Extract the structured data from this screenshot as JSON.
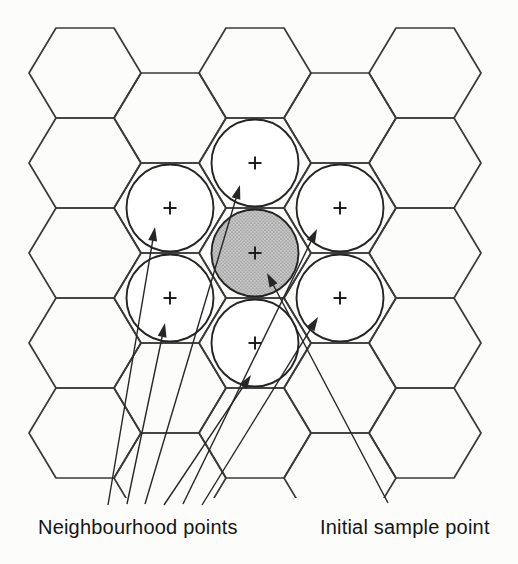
{
  "labels": {
    "neighbourhood": "Neighbourhood points",
    "initial": "Initial sample point"
  },
  "colors": {
    "background": "#fcfcfb",
    "grid_line": "#3a3a3a",
    "circle_outline": "#242424",
    "circle_fill": "#ffffff",
    "shaded_base": "#c9c9c9",
    "shaded_dot": "#8e8e8e",
    "arrow": "#262626",
    "plus": "#161616",
    "text": "#141414"
  },
  "diagram": {
    "width": 518,
    "height": 564,
    "hex": {
      "half_side": 29,
      "half_width": 56,
      "half_height": 45,
      "stroke_width": 1.7,
      "clip_bottom": 498,
      "centers": [
        [
          85,
          73
        ],
        [
          85,
          163
        ],
        [
          85,
          253
        ],
        [
          85,
          343
        ],
        [
          85,
          433
        ],
        [
          255,
          73
        ],
        [
          255,
          163
        ],
        [
          255,
          253
        ],
        [
          255,
          343
        ],
        [
          255,
          433
        ],
        [
          425,
          73
        ],
        [
          425,
          163
        ],
        [
          425,
          253
        ],
        [
          425,
          343
        ],
        [
          425,
          433
        ],
        [
          170,
          118
        ],
        [
          170,
          208
        ],
        [
          170,
          298
        ],
        [
          170,
          388
        ],
        [
          170,
          478
        ],
        [
          340,
          118
        ],
        [
          340,
          208
        ],
        [
          340,
          298
        ],
        [
          340,
          388
        ],
        [
          340,
          478
        ]
      ]
    },
    "circles": {
      "radius": 43.5,
      "stroke_width": 1.9,
      "plus_half": 6.5,
      "plus_stroke": 1.9,
      "items": [
        {
          "name": "initial-sample-circle",
          "cx": 255,
          "cy": 253,
          "shaded": true
        },
        {
          "name": "neighbour-circle-top",
          "cx": 255,
          "cy": 163,
          "shaded": false
        },
        {
          "name": "neighbour-circle-upper-left",
          "cx": 170,
          "cy": 208,
          "shaded": false
        },
        {
          "name": "neighbour-circle-upper-right",
          "cx": 340,
          "cy": 208,
          "shaded": false
        },
        {
          "name": "neighbour-circle-lower-left",
          "cx": 170,
          "cy": 298,
          "shaded": false
        },
        {
          "name": "neighbour-circle-lower-right",
          "cx": 340,
          "cy": 298,
          "shaded": false
        },
        {
          "name": "neighbour-circle-bottom",
          "cx": 255,
          "cy": 343,
          "shaded": false
        }
      ]
    },
    "arrows": {
      "stroke_width": 1.4,
      "head_length": 14,
      "head_width": 9,
      "items": [
        {
          "name": "arrow-neighbour-upper-left",
          "from": [
            108,
            505
          ],
          "to": [
            155,
            227
          ]
        },
        {
          "name": "arrow-neighbour-lower-left",
          "from": [
            127,
            504
          ],
          "to": [
            165,
            323
          ]
        },
        {
          "name": "arrow-neighbour-top",
          "from": [
            145,
            504
          ],
          "to": [
            240,
            185
          ]
        },
        {
          "name": "arrow-neighbour-bottom",
          "from": [
            164,
            505
          ],
          "to": [
            251,
            375
          ]
        },
        {
          "name": "arrow-neighbour-upper-right",
          "from": [
            183,
            504
          ],
          "to": [
            317,
            229
          ]
        },
        {
          "name": "arrow-neighbour-lower-right",
          "from": [
            202,
            505
          ],
          "to": [
            318,
            317
          ]
        },
        {
          "name": "arrow-initial-sample",
          "from": [
            388,
            503
          ],
          "to": [
            267,
            273
          ]
        }
      ]
    }
  }
}
